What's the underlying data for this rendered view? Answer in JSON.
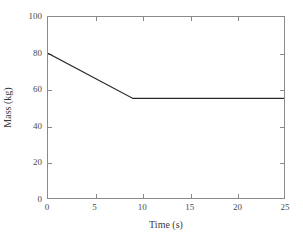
{
  "chart_data": {
    "type": "line",
    "title": "",
    "xlabel": "Time (s)",
    "ylabel": "Mass (kg)",
    "xlim": [
      0,
      25
    ],
    "ylim": [
      0,
      100
    ],
    "xticks": [
      0,
      5,
      10,
      15,
      20,
      25
    ],
    "yticks": [
      0,
      20,
      40,
      60,
      80,
      100
    ],
    "xticklabels": [
      "0",
      "5",
      "10",
      "15",
      "20",
      "25"
    ],
    "yticklabels": [
      "0",
      "20",
      "40",
      "60",
      "80",
      "100"
    ],
    "grid": false,
    "legend": false,
    "legend_position": "none",
    "line_color": "#2a2a2a",
    "axis_color": "#8a8a8a",
    "background_color": "#ffffff",
    "series": [
      {
        "name": "Mass",
        "x": [
          0,
          9,
          25
        ],
        "y": [
          80,
          55,
          55
        ],
        "color": "#2a2a2a",
        "linewidth": 1.2,
        "description": "Mass decreases linearly from 80 kg at t=0 s to 55 kg at t=9 s, then remains constant at 55 kg through t=25 s."
      }
    ]
  }
}
